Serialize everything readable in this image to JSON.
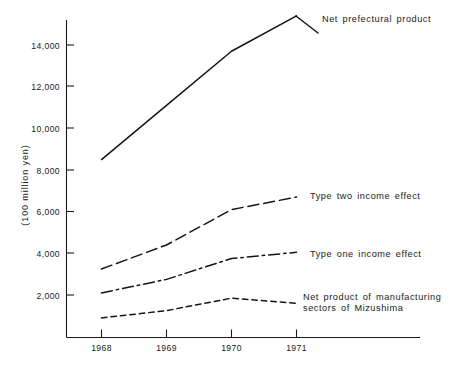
{
  "chart_data": {
    "type": "line",
    "title": "",
    "subtitle": "",
    "xlabel": "",
    "ylabel": "(100 million yen)",
    "categories": [
      "1968",
      "1969",
      "1970",
      "1971"
    ],
    "x": [
      1968,
      1969,
      1970,
      1971
    ],
    "xlim": [
      1967.6,
      1971.45
    ],
    "ylim": [
      0,
      15600
    ],
    "yticks": [
      2000,
      4000,
      6000,
      8000,
      10000,
      12000,
      14000
    ],
    "ytick_labels": [
      "2,000",
      "4,000",
      "6,000",
      "8,000",
      "10,000",
      "12,000",
      "14,000"
    ],
    "grid": false,
    "legend_position": "right-inline-annotations",
    "series": [
      {
        "name": "Net prefectural product",
        "values": [
          8500,
          11100,
          13700,
          15400
        ],
        "style": "solid",
        "label_anchor_year": 1971
      },
      {
        "name": "Type two income effect",
        "values": [
          3250,
          4400,
          6100,
          6700
        ],
        "style": "dashed",
        "label_anchor_year": 1971
      },
      {
        "name": "Type one income effect",
        "values": [
          2100,
          2750,
          3750,
          4050
        ],
        "style": "dash-dot",
        "label_anchor_year": 1971
      },
      {
        "name": "Net product of manufacturing sectors of Mizushima",
        "values": [
          900,
          1250,
          1850,
          1600
        ],
        "style": "fine-dashed",
        "label_anchor_year": 1971
      }
    ],
    "annotations": [
      {
        "text": "Net prefectural product",
        "series": "Net prefectural product"
      },
      {
        "text": "Type two income effect",
        "series": "Type two income effect"
      },
      {
        "text": "Type one income effect",
        "series": "Type one income effect"
      },
      {
        "text": "Net product of manufacturing",
        "series": "Net product of manufacturing sectors of Mizushima"
      },
      {
        "text": "sectors of Mizushima",
        "series": "Net product of manufacturing sectors of Mizushima"
      }
    ],
    "colors": {
      "ink": "#151515",
      "background": "#ffffff"
    }
  },
  "labels": {
    "y_axis_title": "(100 million yen)",
    "series_1": "Net prefectural product",
    "series_2": "Type two income effect",
    "series_3": "Type one income effect",
    "series_4_line1": "Net product of manufacturing",
    "series_4_line2": "sectors of Mizushima",
    "ytick_14000": "14,000",
    "ytick_12000": "12,000",
    "ytick_10000": "10,000",
    "ytick_8000": "8,000",
    "ytick_6000": "6,000",
    "ytick_4000": "4,000",
    "ytick_2000": "2,000",
    "xtick_1968": "1968",
    "xtick_1969": "1969",
    "xtick_1970": "1970",
    "xtick_1971": "1971"
  }
}
